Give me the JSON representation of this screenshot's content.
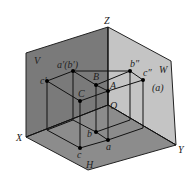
{
  "figure": {
    "type": "three-plane projection diagram",
    "planes": {
      "V": {
        "label": "V",
        "color": "#7a7a7a"
      },
      "W": {
        "label": "W",
        "color": "#c2c2c2"
      },
      "H": {
        "label": "H",
        "color": "#8e8e8e"
      }
    },
    "axes": {
      "X": "X",
      "Y": "Y",
      "Z": "Z",
      "origin": "O"
    },
    "points_3d": {
      "A": "A",
      "B": "B",
      "C": "C"
    },
    "projections": {
      "v_front": {
        "a_b": "a′(b′)",
        "c": "c′"
      },
      "w_side": {
        "b": "b″",
        "c_a": "c″",
        "a_paren": "(a)"
      },
      "h_top": {
        "a": "a",
        "b": "b",
        "c": "c"
      }
    }
  }
}
